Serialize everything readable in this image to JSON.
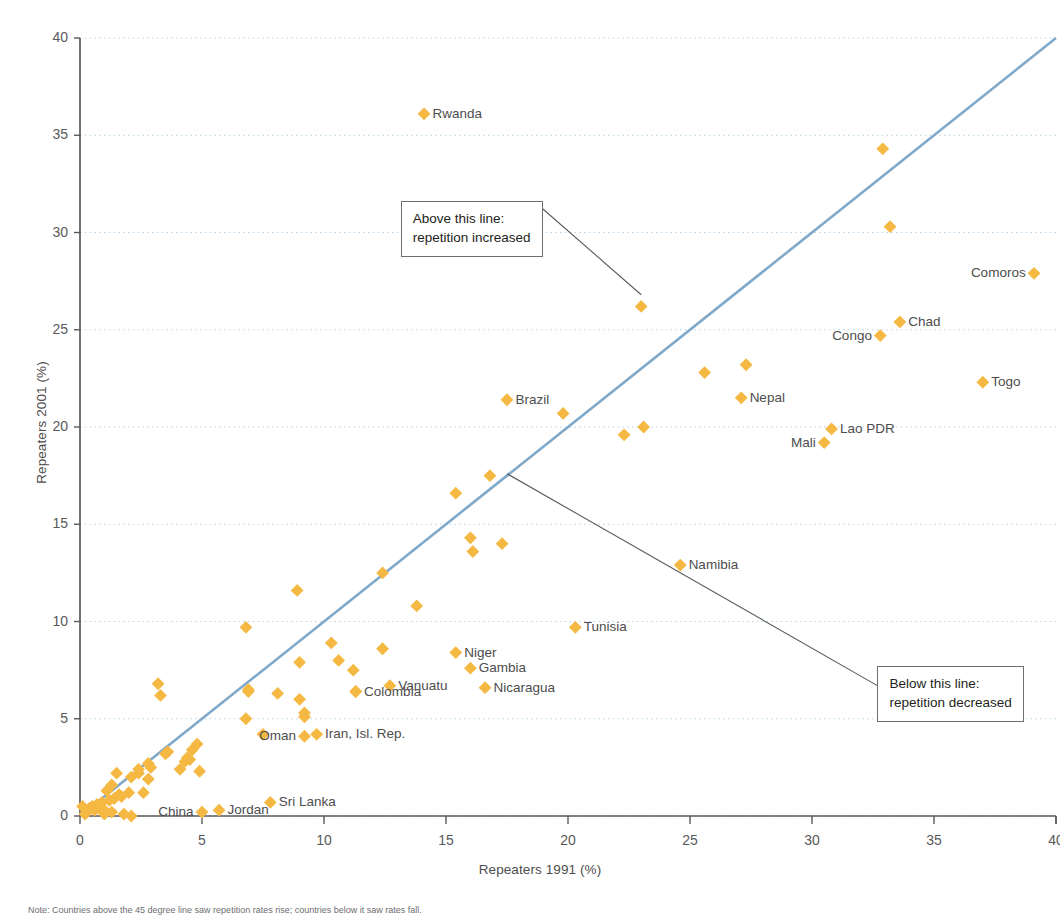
{
  "chart_data": {
    "type": "scatter",
    "title": "",
    "xlabel": "Repeaters 1991 (%)",
    "ylabel": "Repeaters 2001 (%)",
    "xlim": [
      0,
      40
    ],
    "ylim": [
      0,
      40
    ],
    "xticks": [
      0,
      5,
      10,
      15,
      20,
      25,
      30,
      35,
      40
    ],
    "yticks": [
      0,
      5,
      10,
      15,
      20,
      25,
      30,
      35,
      40
    ],
    "grid": "horizontal-dotted",
    "legend": "none",
    "marker": "diamond",
    "marker_color": "#F5B943",
    "reference_line": {
      "label": "y = x diagonal",
      "from": [
        0,
        0
      ],
      "to": [
        40,
        40
      ],
      "color": "#7FA8C9"
    },
    "annotations": [
      {
        "name": "above-line-note",
        "lines": [
          "Above this line:",
          "repetition increased"
        ],
        "box_anchor": [
          7.0,
          30.5
        ],
        "leader_to": [
          23.0,
          26.8
        ]
      },
      {
        "name": "below-line-note",
        "lines": [
          "Below this line:",
          "repetition decreased"
        ],
        "box_anchor": [
          33.5,
          6.6
        ],
        "leader_to": [
          17.5,
          17.6
        ]
      }
    ],
    "labeled_points": [
      {
        "name": "Rwanda",
        "x": 14.1,
        "y": 36.1,
        "label_side": "right"
      },
      {
        "name": "Comoros",
        "x": 39.1,
        "y": 27.9,
        "label_side": "left"
      },
      {
        "name": "Chad",
        "x": 33.6,
        "y": 25.4,
        "label_side": "right"
      },
      {
        "name": "Congo",
        "x": 32.8,
        "y": 24.7,
        "label_side": "left"
      },
      {
        "name": "Togo",
        "x": 37.0,
        "y": 22.3,
        "label_side": "right"
      },
      {
        "name": "Nepal",
        "x": 27.1,
        "y": 21.5,
        "label_side": "right"
      },
      {
        "name": "Brazil",
        "x": 17.5,
        "y": 21.4,
        "label_side": "right"
      },
      {
        "name": "Lao PDR",
        "x": 30.8,
        "y": 19.9,
        "label_side": "right"
      },
      {
        "name": "Mali",
        "x": 30.5,
        "y": 19.2,
        "label_side": "left"
      },
      {
        "name": "Namibia",
        "x": 24.6,
        "y": 12.9,
        "label_side": "right"
      },
      {
        "name": "Tunisia",
        "x": 20.3,
        "y": 9.7,
        "label_side": "right"
      },
      {
        "name": "Niger",
        "x": 15.4,
        "y": 8.4,
        "label_side": "right"
      },
      {
        "name": "Gambia",
        "x": 16.0,
        "y": 7.6,
        "label_side": "right"
      },
      {
        "name": "Nicaragua",
        "x": 16.6,
        "y": 6.6,
        "label_side": "right"
      },
      {
        "name": "Vanuatu",
        "x": 12.7,
        "y": 6.7,
        "label_side": "right"
      },
      {
        "name": "Colombia",
        "x": 11.3,
        "y": 6.4,
        "label_side": "right"
      },
      {
        "name": "Iran, Isl. Rep.",
        "x": 9.7,
        "y": 4.2,
        "label_side": "right"
      },
      {
        "name": "Oman",
        "x": 9.2,
        "y": 4.1,
        "label_side": "left"
      },
      {
        "name": "Sri Lanka",
        "x": 7.8,
        "y": 0.7,
        "label_side": "right"
      },
      {
        "name": "Jordan",
        "x": 5.7,
        "y": 0.3,
        "label_side": "right"
      },
      {
        "name": "China",
        "x": 5.0,
        "y": 0.2,
        "label_side": "left"
      }
    ],
    "unlabeled_points": [
      {
        "x": 32.9,
        "y": 34.3
      },
      {
        "x": 33.2,
        "y": 30.3
      },
      {
        "x": 23.0,
        "y": 26.2
      },
      {
        "x": 25.6,
        "y": 22.8
      },
      {
        "x": 27.3,
        "y": 23.2
      },
      {
        "x": 23.1,
        "y": 20.0
      },
      {
        "x": 22.3,
        "y": 19.6
      },
      {
        "x": 19.8,
        "y": 20.7
      },
      {
        "x": 16.8,
        "y": 17.5
      },
      {
        "x": 15.4,
        "y": 16.6
      },
      {
        "x": 16.0,
        "y": 14.3
      },
      {
        "x": 16.1,
        "y": 13.6
      },
      {
        "x": 17.3,
        "y": 14.0
      },
      {
        "x": 12.4,
        "y": 12.5
      },
      {
        "x": 13.8,
        "y": 10.8
      },
      {
        "x": 8.9,
        "y": 11.6
      },
      {
        "x": 6.8,
        "y": 9.7
      },
      {
        "x": 10.3,
        "y": 8.9
      },
      {
        "x": 12.4,
        "y": 8.6
      },
      {
        "x": 10.6,
        "y": 8.0
      },
      {
        "x": 9.0,
        "y": 7.9
      },
      {
        "x": 11.2,
        "y": 7.5
      },
      {
        "x": 3.2,
        "y": 6.8
      },
      {
        "x": 3.3,
        "y": 6.2
      },
      {
        "x": 6.9,
        "y": 6.5
      },
      {
        "x": 6.9,
        "y": 6.4
      },
      {
        "x": 11.3,
        "y": 6.4
      },
      {
        "x": 8.1,
        "y": 6.3
      },
      {
        "x": 9.0,
        "y": 6.0
      },
      {
        "x": 9.2,
        "y": 5.3
      },
      {
        "x": 9.2,
        "y": 5.1
      },
      {
        "x": 6.8,
        "y": 5.0
      },
      {
        "x": 7.5,
        "y": 4.2
      },
      {
        "x": 4.8,
        "y": 3.7
      },
      {
        "x": 4.6,
        "y": 3.4
      },
      {
        "x": 3.6,
        "y": 3.3
      },
      {
        "x": 3.5,
        "y": 3.2
      },
      {
        "x": 4.4,
        "y": 3.0
      },
      {
        "x": 4.5,
        "y": 2.9
      },
      {
        "x": 4.3,
        "y": 2.8
      },
      {
        "x": 2.8,
        "y": 2.7
      },
      {
        "x": 2.9,
        "y": 2.5
      },
      {
        "x": 4.1,
        "y": 2.4
      },
      {
        "x": 4.9,
        "y": 2.3
      },
      {
        "x": 2.4,
        "y": 2.4
      },
      {
        "x": 1.5,
        "y": 2.2
      },
      {
        "x": 2.4,
        "y": 2.2
      },
      {
        "x": 2.1,
        "y": 2.0
      },
      {
        "x": 2.8,
        "y": 1.9
      },
      {
        "x": 1.3,
        "y": 1.6
      },
      {
        "x": 1.1,
        "y": 1.3
      },
      {
        "x": 2.0,
        "y": 1.2
      },
      {
        "x": 2.6,
        "y": 1.2
      },
      {
        "x": 1.6,
        "y": 1.1
      },
      {
        "x": 1.7,
        "y": 1.0
      },
      {
        "x": 1.4,
        "y": 0.9
      },
      {
        "x": 1.2,
        "y": 0.8
      },
      {
        "x": 0.9,
        "y": 0.7
      },
      {
        "x": 0.7,
        "y": 0.6
      },
      {
        "x": 0.5,
        "y": 0.5
      },
      {
        "x": 0.1,
        "y": 0.5
      },
      {
        "x": 0.4,
        "y": 0.4
      },
      {
        "x": 0.8,
        "y": 0.4
      },
      {
        "x": 1.0,
        "y": 0.3
      },
      {
        "x": 0.6,
        "y": 0.3
      },
      {
        "x": 0.3,
        "y": 0.2
      },
      {
        "x": 1.3,
        "y": 0.2
      },
      {
        "x": 1.8,
        "y": 0.1
      },
      {
        "x": 2.1,
        "y": 0.0
      },
      {
        "x": 0.2,
        "y": 0.1
      },
      {
        "x": 1.0,
        "y": 0.1
      }
    ]
  },
  "axes": {
    "y_title": "Repeaters 2001 (%)",
    "x_title": "Repeaters 1991 (%)",
    "y_tick_labels": [
      "40",
      "35",
      "30",
      "25",
      "20",
      "15",
      "10",
      "5",
      "0"
    ],
    "x_tick_labels": [
      "0",
      "5",
      "10",
      "15",
      "20",
      "25",
      "30",
      "35",
      "40"
    ]
  },
  "notes": {
    "above": {
      "line1": "Above this line:",
      "line2": "repetition increased"
    },
    "below": {
      "line1": "Below this line:",
      "line2": "repetition decreased"
    },
    "footer": "Note: Countries above the 45 degree line saw repetition rates rise; countries below it saw rates fall."
  },
  "colors": {
    "marker": "#F5B943",
    "reference_line": "#7FA8C9",
    "grid": "#BBD6E8",
    "axis": "#58595b",
    "text": "#4d4d4d",
    "leader": "#58595b"
  }
}
